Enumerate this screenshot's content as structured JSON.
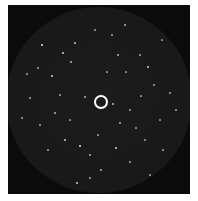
{
  "image": {
    "subject": "star-field",
    "background_color": "#ffffff",
    "field_color": "#0b0b0b",
    "fov_color": "#1a1a1a",
    "marker": {
      "cx": 101,
      "cy": 102,
      "r": 7,
      "color": "#ffffff"
    },
    "stars": [
      [
        42,
        45,
        1.6,
        0.8
      ],
      [
        63,
        53,
        1.4,
        0.7
      ],
      [
        75,
        43,
        1.2,
        0.6
      ],
      [
        71,
        62,
        1.3,
        0.6
      ],
      [
        38,
        68,
        1.2,
        0.5
      ],
      [
        52,
        76,
        1.4,
        0.7
      ],
      [
        27,
        74,
        1.2,
        0.5
      ],
      [
        112,
        35,
        1.2,
        0.5
      ],
      [
        118,
        55,
        1.3,
        0.6
      ],
      [
        140,
        55,
        1.2,
        0.5
      ],
      [
        148,
        67,
        1.6,
        0.7
      ],
      [
        154,
        85,
        1.2,
        0.5
      ],
      [
        126,
        72,
        1.2,
        0.5
      ],
      [
        95,
        30,
        1.2,
        0.5
      ],
      [
        125,
        25,
        1.3,
        0.6
      ],
      [
        162,
        40,
        1.2,
        0.5
      ],
      [
        170,
        93,
        1.2,
        0.5
      ],
      [
        85,
        97,
        1.3,
        0.6
      ],
      [
        113,
        104,
        1.3,
        0.6
      ],
      [
        130,
        110,
        1.2,
        0.5
      ],
      [
        55,
        113,
        1.3,
        0.6
      ],
      [
        40,
        125,
        1.2,
        0.5
      ],
      [
        65,
        140,
        1.5,
        0.7
      ],
      [
        80,
        146,
        1.6,
        0.8
      ],
      [
        90,
        155,
        1.3,
        0.6
      ],
      [
        120,
        123,
        1.3,
        0.6
      ],
      [
        116,
        148,
        1.4,
        0.7
      ],
      [
        145,
        140,
        1.2,
        0.5
      ],
      [
        160,
        120,
        1.2,
        0.5
      ],
      [
        101,
        170,
        1.3,
        0.6
      ],
      [
        77,
        183,
        1.5,
        0.7
      ],
      [
        90,
        178,
        1.2,
        0.5
      ],
      [
        130,
        162,
        1.2,
        0.5
      ],
      [
        163,
        150,
        1.2,
        0.5
      ],
      [
        48,
        150,
        1.2,
        0.5
      ],
      [
        30,
        98,
        1.2,
        0.5
      ],
      [
        22,
        118,
        1.2,
        0.5
      ],
      [
        107,
        72,
        1.2,
        0.5
      ],
      [
        141,
        96,
        1.2,
        0.5
      ],
      [
        60,
        95,
        1.2,
        0.5
      ],
      [
        176,
        110,
        1.2,
        0.5
      ],
      [
        70,
        120,
        1.2,
        0.5
      ],
      [
        136,
        128,
        1.2,
        0.5
      ],
      [
        98,
        135,
        1.2,
        0.5
      ],
      [
        150,
        175,
        1.2,
        0.5
      ]
    ]
  }
}
